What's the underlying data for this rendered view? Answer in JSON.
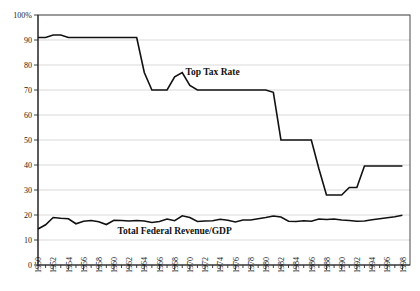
{
  "chart_data": {
    "type": "line",
    "title": "",
    "xlabel": "",
    "ylabel": "",
    "xlim": [
      1950,
      1999
    ],
    "ylim": [
      0,
      100
    ],
    "grid": true,
    "legend_position": "inline-annotations",
    "y_ticks": [
      "0",
      "10",
      "20",
      "30",
      "40",
      "50",
      "60",
      "70",
      "80",
      "90",
      "100%"
    ],
    "y_tick_values": [
      0,
      10,
      20,
      30,
      40,
      50,
      60,
      70,
      80,
      90,
      100
    ],
    "x_tick_labels": [
      "1950",
      "1952",
      "1954",
      "1956",
      "1958",
      "1960",
      "1962",
      "1964",
      "1966",
      "1968",
      "1970",
      "1972",
      "1974",
      "1976",
      "1978",
      "1980",
      "1982",
      "1984",
      "1986",
      "1988",
      "1990",
      "1992",
      "1994",
      "1996",
      "1998"
    ],
    "x_minor_tick_years": [
      1951,
      1953,
      1955,
      1957,
      1959,
      1961,
      1963,
      1965,
      1967,
      1969,
      1971,
      1973,
      1975,
      1977,
      1979,
      1981,
      1983,
      1985,
      1987,
      1989,
      1991,
      1993,
      1995,
      1997
    ],
    "x": [
      1950,
      1951,
      1952,
      1953,
      1954,
      1955,
      1956,
      1957,
      1958,
      1959,
      1960,
      1961,
      1962,
      1963,
      1964,
      1965,
      1966,
      1967,
      1968,
      1969,
      1970,
      1971,
      1972,
      1973,
      1974,
      1975,
      1976,
      1977,
      1978,
      1979,
      1980,
      1981,
      1982,
      1983,
      1984,
      1985,
      1986,
      1987,
      1988,
      1989,
      1990,
      1991,
      1992,
      1993,
      1994,
      1995,
      1996,
      1997,
      1998
    ],
    "series": [
      {
        "name": "Top Tax Rate",
        "color": "#111111",
        "annotation": "Top Tax Rate",
        "annotation_year": 1973,
        "annotation_value": 76,
        "values": [
          91.0,
          91.0,
          92.0,
          92.0,
          91.0,
          91.0,
          91.0,
          91.0,
          91.0,
          91.0,
          91.0,
          91.0,
          91.0,
          91.0,
          77.0,
          70.0,
          70.0,
          70.0,
          75.3,
          77.0,
          71.8,
          70.0,
          70.0,
          70.0,
          70.0,
          70.0,
          70.0,
          70.0,
          70.0,
          70.0,
          70.0,
          69.1,
          50.0,
          50.0,
          50.0,
          50.0,
          50.0,
          38.5,
          28.0,
          28.0,
          28.0,
          31.0,
          31.0,
          39.6,
          39.6,
          39.6,
          39.6,
          39.6,
          39.6
        ]
      },
      {
        "name": "Total Federal Revenue/GDP",
        "color": "#111111",
        "annotation": "Total Federal Revenue/GDP",
        "annotation_year": 1968,
        "annotation_value": 12.5,
        "values": [
          14.4,
          16.1,
          19.0,
          18.7,
          18.5,
          16.5,
          17.5,
          17.8,
          17.3,
          16.2,
          17.9,
          17.8,
          17.6,
          17.8,
          17.6,
          17.0,
          17.4,
          18.4,
          17.7,
          19.7,
          19.0,
          17.4,
          17.6,
          17.7,
          18.3,
          17.9,
          17.2,
          18.0,
          18.0,
          18.5,
          19.0,
          19.6,
          19.2,
          17.5,
          17.4,
          17.7,
          17.5,
          18.4,
          18.2,
          18.4,
          18.0,
          17.8,
          17.5,
          17.6,
          18.1,
          18.5,
          18.9,
          19.3,
          19.9
        ]
      }
    ]
  },
  "annotations": {
    "top_tax_rate_label": "Top Tax Rate",
    "revenue_label": "Total Federal Revenue/GDP"
  }
}
